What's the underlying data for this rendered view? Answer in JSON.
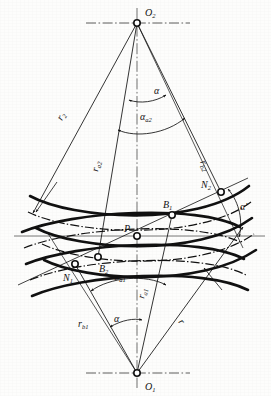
{
  "figure": {
    "type": "engineering-diagram",
    "background_color": "#fdfdfc",
    "line_color": "#111111",
    "centerline_color": "#333333"
  },
  "points": [
    {
      "id": "O2",
      "label": "O",
      "sub": "2",
      "x": 137,
      "y": 23,
      "role": "center-of-gear-2"
    },
    {
      "id": "O1",
      "label": "O",
      "sub": "1",
      "x": 137,
      "y": 373,
      "role": "center-of-gear-1"
    },
    {
      "id": "P",
      "label": "P",
      "sub": "",
      "x": 137,
      "y": 236,
      "role": "pitch-point"
    },
    {
      "id": "B1",
      "label": "B",
      "sub": "1",
      "x": 172,
      "y": 215,
      "role": "contact-start"
    },
    {
      "id": "B2",
      "label": "B",
      "sub": "2",
      "x": 98,
      "y": 257,
      "role": "contact-end"
    },
    {
      "id": "N2",
      "label": "N",
      "sub": "2",
      "x": 221,
      "y": 192,
      "role": "base-tangent-point-2"
    },
    {
      "id": "N1",
      "label": "N",
      "sub": "1",
      "x": 75,
      "y": 264,
      "role": "base-tangent-point-1"
    }
  ],
  "labels": {
    "O2": {
      "text": "O",
      "sub": "2"
    },
    "O1": {
      "text": "O",
      "sub": "1"
    },
    "P": {
      "text": "P",
      "sub": ""
    },
    "B1": {
      "text": "B",
      "sub": "1"
    },
    "B2": {
      "text": "B",
      "sub": "2"
    },
    "N1": {
      "text": "N",
      "sub": "1"
    },
    "N2": {
      "text": "N",
      "sub": "2"
    },
    "r2": {
      "text": "r",
      "sub": "2"
    },
    "ra2": {
      "text": "r",
      "sub": "a2"
    },
    "rb2": {
      "text": "r",
      "sub": "b2"
    },
    "ra1": {
      "text": "r",
      "sub": "a1"
    },
    "rb1": {
      "text": "r",
      "sub": "b1"
    },
    "r1": {
      "text": "r",
      "sub": ""
    },
    "alpha_top": {
      "text": "α",
      "sub": ""
    },
    "alpha_a2": {
      "text": "α",
      "sub": "a2"
    },
    "alpha_a1": {
      "text": "α",
      "sub": "a1"
    },
    "alpha_bottom": {
      "text": "α",
      "sub": ""
    },
    "alpha_prime": {
      "text": "α'",
      "sub": ""
    }
  },
  "label_positions": {
    "O2": {
      "x": 145,
      "y": 16
    },
    "O1": {
      "x": 145,
      "y": 387
    },
    "P": {
      "x": 127,
      "y": 230
    },
    "B1": {
      "x": 165,
      "y": 206
    },
    "B2": {
      "x": 100,
      "y": 270
    },
    "N1": {
      "x": 66,
      "y": 279
    },
    "N2": {
      "x": 203,
      "y": 186
    },
    "r2": {
      "x": 62,
      "y": 121,
      "rotate": -68
    },
    "ra2": {
      "x": 99,
      "y": 170,
      "rotate": -78
    },
    "rb2": {
      "x": 199,
      "y": 160,
      "rotate": 62
    },
    "ra1": {
      "x": 143,
      "y": 297,
      "rotate": -76
    },
    "rb1": {
      "x": 82,
      "y": 324
    },
    "r1": {
      "x": 178,
      "y": 320,
      "rotate": 52
    },
    "alpha_top": {
      "x": 158,
      "y": 96
    },
    "alpha_a2": {
      "x": 143,
      "y": 120
    },
    "alpha_a1": {
      "x": 117,
      "y": 281
    },
    "alpha_bottom": {
      "x": 116,
      "y": 323
    },
    "alpha_prime": {
      "x": 242,
      "y": 207
    }
  },
  "geometry": {
    "centerline_vertical_x": 137,
    "centerline_horizontal_y": 236,
    "horizontal_axis_extent": [
      14,
      265
    ],
    "line_of_action": {
      "from": "N1",
      "to": "N2"
    },
    "radii_lines": [
      {
        "name": "r2",
        "from": "O2",
        "to_point": [
          33,
          213
        ]
      },
      {
        "name": "ra2",
        "from": "O2",
        "to_point": [
          98,
          257
        ]
      },
      {
        "name": "rb2",
        "from": "O2",
        "to_point": [
          221,
          192
        ]
      },
      {
        "name": "ra1",
        "from": "O1",
        "to_point": [
          172,
          215
        ]
      },
      {
        "name": "rb1",
        "from": "O1",
        "to_point": [
          75,
          264
        ]
      },
      {
        "name": "r1",
        "from": "O1",
        "to_point": [
          243,
          227
        ]
      }
    ]
  },
  "angle_arcs": [
    {
      "name": "alpha_top",
      "about": "O2",
      "radius": 78,
      "start_deg": 84,
      "end_deg": 106
    },
    {
      "name": "alpha_a2",
      "about": "O2",
      "radius": 107,
      "start_deg": 75,
      "end_deg": 113
    },
    {
      "name": "alpha_a1",
      "about": "O1",
      "radius": 105,
      "start_deg": 68,
      "end_deg": 112
    },
    {
      "name": "alpha_bottom",
      "about": "O1",
      "radius": 57,
      "start_deg": 75,
      "end_deg": 101
    },
    {
      "name": "alpha_prime",
      "about": "P",
      "radius": 107,
      "start_deg": -22,
      "end_deg": 2
    }
  ],
  "curve_sets": {
    "gear2_tooth_profiles": 3,
    "gear1_tooth_profiles": 3,
    "pitch_circle_style": "dash-dot",
    "profile_style": "solid-thick"
  }
}
